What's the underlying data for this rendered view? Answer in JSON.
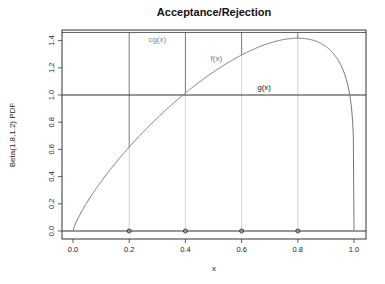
{
  "chart_data": {
    "type": "line",
    "title": "Acceptance/Rejection",
    "xlabel": "x",
    "ylabel": "Beta(1.8,1.2) PDF",
    "xlim": [
      -0.04,
      1.04
    ],
    "ylim": [
      -0.06,
      1.48
    ],
    "x_ticks": [
      "0.0",
      "0.2",
      "0.4",
      "0.6",
      "0.8",
      "1.0"
    ],
    "y_ticks": [
      "0.0",
      "0.2",
      "0.4",
      "0.6",
      "0.8",
      "1.0",
      "1.2",
      "1.4"
    ],
    "grid": false,
    "series": [
      {
        "name": "f(x)",
        "description": "Beta(1.8,1.2) density",
        "alpha": 1.8,
        "beta": 1.2,
        "color": "#777777"
      },
      {
        "name": "g(x)",
        "description": "Uniform(0,1) density",
        "value": 1.0,
        "color": "#333333"
      },
      {
        "name": "cg(x)",
        "description": "scaled envelope",
        "value": 1.46,
        "color": "#333333"
      }
    ],
    "sample_points": {
      "x": [
        0.2,
        0.4,
        0.6,
        0.8
      ],
      "y": [
        0,
        0,
        0,
        0
      ]
    },
    "vertical_segments": [
      {
        "x": 0.2,
        "f": 0.63,
        "cg": 1.46
      },
      {
        "x": 0.4,
        "f": 1.02,
        "cg": 1.46
      },
      {
        "x": 0.6,
        "f": 1.29,
        "cg": 1.46
      },
      {
        "x": 0.8,
        "f": 1.42,
        "cg": 1.46
      }
    ],
    "annotations": [
      {
        "text": "cg(x)",
        "x": 0.3,
        "y": 1.39
      },
      {
        "text": "f(x)",
        "x": 0.51,
        "y": 1.25
      },
      {
        "text": "g(x)",
        "x": 0.68,
        "y": 1.04
      }
    ]
  }
}
